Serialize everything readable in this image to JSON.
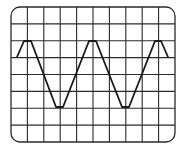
{
  "diagram": {
    "type": "oscilloscope-screen",
    "grid": {
      "columns": 10,
      "rows": 8
    },
    "frame": {
      "x": 11,
      "y": 7,
      "width": 164,
      "height": 135,
      "corner_radius": 9
    },
    "waveform": {
      "shape": "triangle-like (trapezoidal peaks)",
      "cycles_visible": 2.5,
      "peak_y_division": 2,
      "trough_y_division": 6,
      "points": [
        [
          17,
          57
        ],
        [
          24,
          41
        ],
        [
          31,
          41
        ],
        [
          56,
          107
        ],
        [
          63,
          107
        ],
        [
          89,
          41
        ],
        [
          96,
          41
        ],
        [
          122,
          107
        ],
        [
          129,
          107
        ],
        [
          155,
          41
        ],
        [
          161,
          41
        ],
        [
          168,
          57
        ]
      ]
    },
    "colors": {
      "background": "#ffffff",
      "grid": "#2a2a2a",
      "trace": "#1a1a1a"
    }
  }
}
